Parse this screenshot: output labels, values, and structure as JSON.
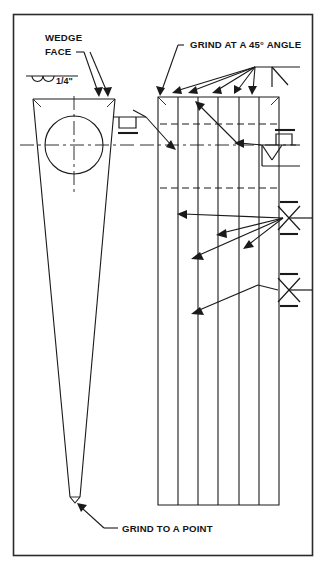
{
  "drawing": {
    "title": "Wedge grinding detail drawing",
    "background_color": "#ffffff",
    "line_color": "#1a1a1a",
    "frame_color": "#2b2b2b",
    "annotations": {
      "wedge_face_line1": "WEDGE",
      "wedge_face_line2": "FACE",
      "surface_finish": "1/4\"",
      "grind_45": "GRIND AT A 45° ANGLE",
      "grind_point": "GRIND TO A POINT"
    },
    "views": {
      "left_view": {
        "name": "wedge-front-view",
        "description": "Tapered wedge seen face-on with bore circle"
      },
      "right_view": {
        "name": "wedge-side-view",
        "description": "Rectangular side view with six ground segments"
      }
    },
    "icons": {
      "weld_square_groove": "square-groove-weld-icon",
      "weld_bevel": "bevel-weld-icon",
      "weld_x_double_v": "double-v-groove-weld-icon",
      "finish_scallop": "surface-finish-icon"
    }
  }
}
